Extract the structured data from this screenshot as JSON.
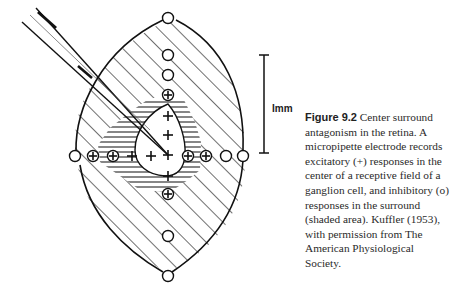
{
  "figure": {
    "scale_bar_label": "Imm",
    "markers": {
      "horizontal_row": [
        "o",
        "⊕",
        "⊕",
        "+",
        "+",
        "+",
        "⊕",
        "⊕",
        "o",
        "o"
      ],
      "vertical_column": [
        "o",
        "o",
        "o",
        "⊕",
        "+",
        "+",
        "+",
        "+",
        "⊕",
        "o",
        "o"
      ]
    },
    "legend_symbols": {
      "excitatory": "+",
      "inhibitory": "o",
      "mixed": "⊕"
    }
  },
  "caption": {
    "label": "Figure 9.2",
    "text": " Center surround antagonism in the retina. A micropipette electrode records excitatory (+) responses in the center of a receptive field of a ganglion cell, and inhibitory (o) responses in the surround (shaded area). Kuffler (1953), with permission from The American Physiological Society."
  }
}
